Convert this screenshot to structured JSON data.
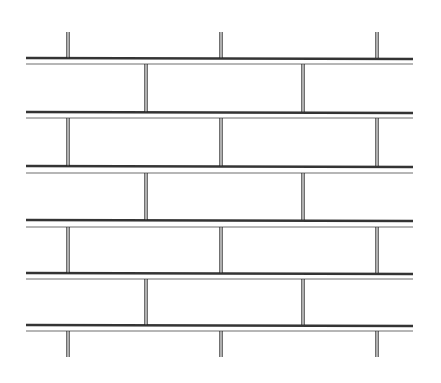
{
  "figure": {
    "width": 441,
    "height": 383,
    "stroke_color": "#1e1e1e",
    "background": "#ffffff",
    "x_start": 26,
    "x_end": 413,
    "courses": [
      {
        "thick_y": 58,
        "thin_y": 64
      },
      {
        "thick_y": 112,
        "thin_y": 118
      },
      {
        "thick_y": 166,
        "thin_y": 173
      },
      {
        "thick_y": 220,
        "thin_y": 227
      },
      {
        "thick_y": 273,
        "thin_y": 279
      },
      {
        "thick_y": 325,
        "thin_y": 331
      }
    ],
    "head_joints": [
      {
        "y1": 32,
        "y2": 58,
        "xs": [
          68,
          221,
          377
        ]
      },
      {
        "y1": 64,
        "y2": 112,
        "xs": [
          146,
          303
        ]
      },
      {
        "y1": 118,
        "y2": 166,
        "xs": [
          68,
          221,
          377
        ]
      },
      {
        "y1": 173,
        "y2": 220,
        "xs": [
          146,
          303
        ]
      },
      {
        "y1": 227,
        "y2": 273,
        "xs": [
          68,
          221,
          377
        ]
      },
      {
        "y1": 279,
        "y2": 325,
        "xs": [
          146,
          303
        ]
      },
      {
        "y1": 331,
        "y2": 357,
        "xs": [
          68,
          221,
          377
        ]
      }
    ]
  }
}
